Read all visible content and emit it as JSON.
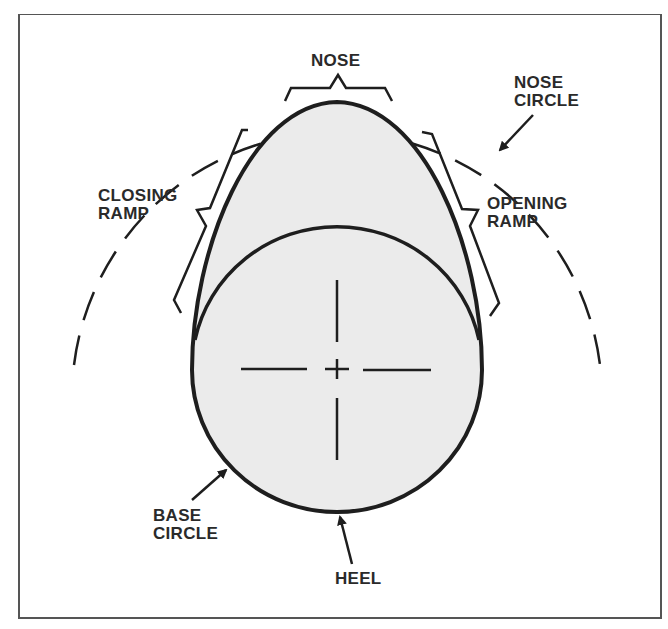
{
  "diagram": {
    "colors": {
      "outline": "#1e1e1e",
      "fill": "#ebebeb",
      "frame": "#555555",
      "background": "#ffffff"
    },
    "labels": {
      "nose": "NOSE",
      "nose_circle": "NOSE\nCIRCLE",
      "closing_ramp": "CLOSING\nRAMP",
      "opening_ramp": "OPENING\nRAMP",
      "base_circle": "BASE\nCIRCLE",
      "heel": "HEEL"
    }
  }
}
